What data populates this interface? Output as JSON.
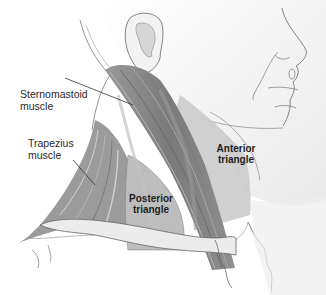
{
  "figure": {
    "labels": {
      "sternomastoid": [
        "Sternomastoid",
        "muscle"
      ],
      "trapezius": [
        "Trapezius",
        "muscle"
      ],
      "anterior": [
        "Anterior",
        "triangle"
      ],
      "posterior": [
        "Posterior",
        "triangle"
      ]
    },
    "colors": {
      "skin": "#f2f2f2",
      "skin_shade": "#d9d9d9",
      "muscle": "#8a8a8a",
      "muscle_dark": "#6e6e6e",
      "triangle_fill": "#bdbdbd",
      "outline": "#555555",
      "leader": "#333333"
    }
  }
}
